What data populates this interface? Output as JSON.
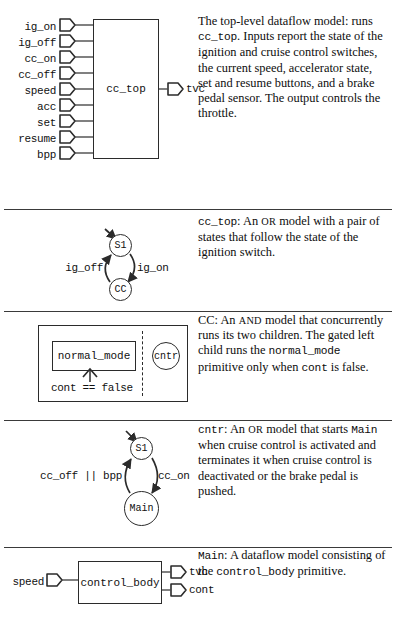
{
  "figure": {
    "caption_rows": 5,
    "rows": [
      {
        "id": "row-dataflow-top",
        "diagram": {
          "kind": "dataflow-block",
          "block_label": "cc_top",
          "inputs": [
            "ig_on",
            "ig_off",
            "cc_on",
            "cc_off",
            "speed",
            "acc",
            "set",
            "resume",
            "bpp"
          ],
          "outputs": [
            "tvc"
          ]
        },
        "description": {
          "segments": [
            {
              "text": "The top-level dataflow model: runs ",
              "style": "serif"
            },
            {
              "text": "cc_top",
              "style": "mono"
            },
            {
              "text": ". Inputs report the state of the ignition and cruise control switches, the current speed, accelerator state, set and resume buttons, and a brake pedal sensor. The output controls the throttle.",
              "style": "serif"
            }
          ]
        }
      },
      {
        "id": "row-cc-top-or",
        "diagram": {
          "kind": "or-state-machine",
          "states": [
            "S1",
            "CC"
          ],
          "initial_state": "S1",
          "transitions": [
            {
              "from": "S1",
              "to": "CC",
              "label": "ig_on"
            },
            {
              "from": "CC",
              "to": "S1",
              "label": "ig_off"
            }
          ]
        },
        "description": {
          "segments": [
            {
              "text": "cc_top",
              "style": "mono"
            },
            {
              "text": ": An ",
              "style": "serif"
            },
            {
              "text": "or",
              "style": "smallcaps"
            },
            {
              "text": " model with a pair of states that follow the state of the ignition switch.",
              "style": "serif"
            }
          ]
        }
      },
      {
        "id": "row-cc-and",
        "diagram": {
          "kind": "and-model",
          "children": [
            "normal_mode",
            "cntr"
          ],
          "gate_condition": "cont == false"
        },
        "description": {
          "segments": [
            {
              "text": "CC: An ",
              "style": "serif"
            },
            {
              "text": "and",
              "style": "smallcaps"
            },
            {
              "text": " model that concurrently runs its two children. The gated left child runs the ",
              "style": "serif"
            },
            {
              "text": "normal_mode",
              "style": "mono"
            },
            {
              "text": " primitive only when ",
              "style": "serif"
            },
            {
              "text": "cont",
              "style": "mono"
            },
            {
              "text": " is false.",
              "style": "serif"
            }
          ]
        }
      },
      {
        "id": "row-cntr-or",
        "diagram": {
          "kind": "or-state-machine",
          "states": [
            "S1",
            "Main"
          ],
          "initial_state": "S1",
          "transitions": [
            {
              "from": "S1",
              "to": "Main",
              "label": "cc_on"
            },
            {
              "from": "Main",
              "to": "S1",
              "label": "cc_off || bpp"
            }
          ]
        },
        "description": {
          "segments": [
            {
              "text": "cntr",
              "style": "mono"
            },
            {
              "text": ": An ",
              "style": "serif"
            },
            {
              "text": "or",
              "style": "smallcaps"
            },
            {
              "text": " model that starts ",
              "style": "serif"
            },
            {
              "text": "Main",
              "style": "mono"
            },
            {
              "text": " when cruise control is activated and terminates it when cruise control is deactivated or the brake pedal is pushed.",
              "style": "serif"
            }
          ]
        }
      },
      {
        "id": "row-main-dataflow",
        "diagram": {
          "kind": "dataflow-block",
          "block_label": "control_body",
          "inputs": [
            "speed"
          ],
          "outputs": [
            "tvc",
            "cont"
          ]
        },
        "description": {
          "segments": [
            {
              "text": "Main",
              "style": "mono"
            },
            {
              "text": ": A dataflow model consisting of the ",
              "style": "serif"
            },
            {
              "text": "control_body",
              "style": "mono"
            },
            {
              "text": " primitive.",
              "style": "serif"
            }
          ]
        }
      }
    ]
  },
  "colors": {
    "ink": "#111111",
    "line": "#2b2b2b",
    "wire": "#4a4a4a",
    "rule": "#3a3a3a",
    "background": "#ffffff"
  }
}
